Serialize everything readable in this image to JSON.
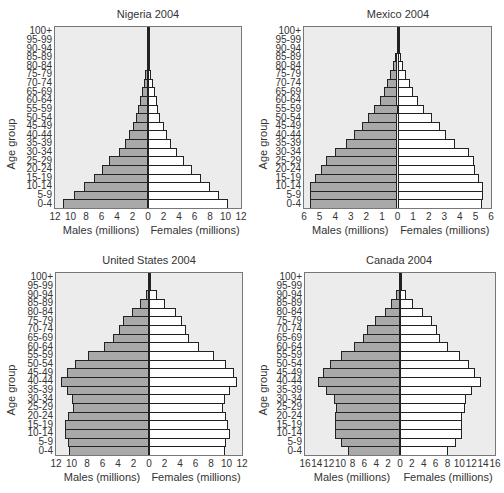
{
  "colors": {
    "male": "#a9a9a9",
    "female": "#ffffff",
    "plot_bg": "#ececec",
    "border": "#222222"
  },
  "chart_data": [
    {
      "type": "bar",
      "orientation": "horizontal-pyramid",
      "title": "Nigeria 2004",
      "ylabel": "Age group",
      "xlabel_left": "Males (millions)",
      "xlabel_right": "Females (millions)",
      "categories": [
        "0-4",
        "5-9",
        "10-14",
        "15-19",
        "20-24",
        "25-29",
        "30-34",
        "35-39",
        "40-44",
        "45-49",
        "50-54",
        "55-59",
        "60-64",
        "65-69",
        "70-74",
        "75-79",
        "80-84",
        "85-89",
        "90-94",
        "95-99",
        "100+"
      ],
      "x_ticks": [
        12,
        10,
        8,
        6,
        4,
        2,
        0,
        2,
        4,
        6,
        8,
        10,
        12
      ],
      "xlim": 12,
      "series": [
        {
          "name": "Males",
          "values": [
            11.0,
            9.5,
            8.2,
            7.0,
            6.0,
            5.0,
            3.8,
            3.0,
            2.4,
            2.0,
            1.6,
            1.3,
            1.0,
            0.8,
            0.55,
            0.35,
            0.15,
            0.05,
            0.02,
            0.01,
            0.0
          ]
        },
        {
          "name": "Females",
          "values": [
            10.3,
            9.2,
            8.0,
            6.8,
            5.7,
            4.7,
            3.7,
            3.0,
            2.5,
            2.0,
            1.6,
            1.3,
            1.1,
            0.9,
            0.6,
            0.4,
            0.2,
            0.07,
            0.03,
            0.01,
            0.0
          ]
        }
      ]
    },
    {
      "type": "bar",
      "orientation": "horizontal-pyramid",
      "title": "Mexico 2004",
      "ylabel": "Age group",
      "xlabel_left": "Males (millions)",
      "xlabel_right": "Females (millions)",
      "categories": [
        "0-4",
        "5-9",
        "10-14",
        "15-19",
        "20-24",
        "25-29",
        "30-34",
        "35-39",
        "40-44",
        "45-49",
        "50-54",
        "55-59",
        "60-64",
        "65-69",
        "70-74",
        "75-79",
        "80-84",
        "85-89",
        "90-94",
        "95-99",
        "100+"
      ],
      "x_ticks": [
        6,
        5,
        4,
        3,
        2,
        1,
        0,
        1,
        2,
        3,
        4,
        5,
        6
      ],
      "xlim": 6,
      "series": [
        {
          "name": "Males",
          "values": [
            5.6,
            5.6,
            5.6,
            5.3,
            4.9,
            4.6,
            4.0,
            3.3,
            2.8,
            2.3,
            1.9,
            1.5,
            1.1,
            0.85,
            0.65,
            0.45,
            0.3,
            0.15,
            0.05,
            0.02,
            0.0
          ]
        },
        {
          "name": "Females",
          "values": [
            5.4,
            5.5,
            5.5,
            5.2,
            5.0,
            4.9,
            4.6,
            3.7,
            3.1,
            2.7,
            2.2,
            1.7,
            1.3,
            1.0,
            0.8,
            0.55,
            0.35,
            0.2,
            0.07,
            0.02,
            0.0
          ]
        }
      ]
    },
    {
      "type": "bar",
      "orientation": "horizontal-pyramid",
      "title": "United States 2004",
      "ylabel": "Age group",
      "xlabel_left": "Males (millions)",
      "xlabel_right": "Females (millions)",
      "categories": [
        "0-4",
        "5-9",
        "10-14",
        "15-19",
        "20-24",
        "25-29",
        "30-34",
        "35-39",
        "40-44",
        "45-49",
        "50-54",
        "55-59",
        "60-64",
        "65-69",
        "70-74",
        "75-79",
        "80-84",
        "85-89",
        "90-94",
        "95-99",
        "100+"
      ],
      "x_ticks": [
        12,
        10,
        8,
        6,
        4,
        2,
        0,
        2,
        4,
        6,
        8,
        10,
        12
      ],
      "xlim": 12,
      "series": [
        {
          "name": "Males",
          "values": [
            10.3,
            10.4,
            10.9,
            10.8,
            10.4,
            9.8,
            9.9,
            10.6,
            11.3,
            10.6,
            9.5,
            7.9,
            5.8,
            4.6,
            3.9,
            3.3,
            2.2,
            1.2,
            0.4,
            0.1,
            0.02
          ]
        },
        {
          "name": "Females",
          "values": [
            9.8,
            9.9,
            10.4,
            10.2,
            9.9,
            9.6,
            9.8,
            10.5,
            11.3,
            11.0,
            9.9,
            8.4,
            6.4,
            5.2,
            4.8,
            4.3,
            3.5,
            2.0,
            1.0,
            0.3,
            0.05
          ]
        }
      ]
    },
    {
      "type": "bar",
      "orientation": "horizontal-pyramid",
      "title": "Canada 2004",
      "ylabel": "Age group",
      "xlabel_left": "Males (millions)",
      "xlabel_right": "Females (millions)",
      "categories": [
        "0-4",
        "5-9",
        "10-14",
        "15-19",
        "20-24",
        "25-29",
        "30-34",
        "35-39",
        "40-44",
        "45-49",
        "50-54",
        "55-59",
        "60-64",
        "65-69",
        "70-74",
        "75-79",
        "80-84",
        "85-89",
        "90-94",
        "95-99",
        "100+"
      ],
      "x_ticks": [
        16,
        14,
        12,
        10,
        8,
        6,
        4,
        2,
        0,
        2,
        4,
        6,
        8,
        10,
        12,
        14,
        16
      ],
      "xlim": 16,
      "series": [
        {
          "name": "Males",
          "values": [
            8.8,
            10.0,
            10.9,
            11.0,
            11.0,
            10.8,
            11.2,
            12.4,
            13.8,
            12.9,
            11.8,
            10.0,
            7.8,
            6.2,
            5.5,
            4.2,
            2.6,
            1.5,
            0.6,
            0.2,
            0.02
          ]
        },
        {
          "name": "Females",
          "values": [
            8.1,
            9.4,
            10.4,
            10.4,
            10.4,
            10.9,
            11.1,
            12.1,
            13.6,
            12.7,
            11.7,
            10.1,
            8.0,
            6.7,
            6.2,
            5.4,
            3.9,
            2.2,
            1.0,
            0.3,
            0.05
          ]
        }
      ]
    }
  ],
  "layout": [
    {
      "left": 0,
      "top": 0,
      "plot": {
        "x": 54,
        "y": 26,
        "w": 188,
        "h": 183
      },
      "title_cx": 148
    },
    {
      "left": 252,
      "top": 0,
      "plot": {
        "x": 51,
        "y": 26,
        "w": 189,
        "h": 183
      },
      "title_cx": 146
    },
    {
      "left": 0,
      "top": 252,
      "plot": {
        "x": 55,
        "y": 20,
        "w": 188,
        "h": 184
      },
      "title_cx": 149
    },
    {
      "left": 252,
      "top": 252,
      "plot": {
        "x": 52,
        "y": 20,
        "w": 192,
        "h": 184
      },
      "title_cx": 147
    }
  ]
}
